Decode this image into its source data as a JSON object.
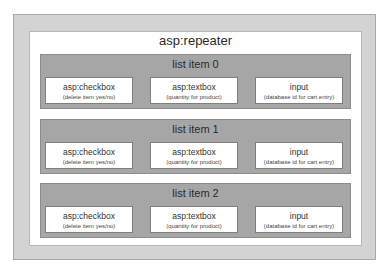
{
  "diagram": {
    "container": {
      "title": "asp:repeater"
    },
    "list_items": [
      {
        "label": "list item 0",
        "cells": [
          {
            "name": "asp:checkbox",
            "desc": "(delete item yes/no)"
          },
          {
            "name": "asp:textbox",
            "desc": "(quantity for product)"
          },
          {
            "name": "input",
            "desc": "(database id for cart entry)"
          }
        ]
      },
      {
        "label": "list item 1",
        "cells": [
          {
            "name": "asp:checkbox",
            "desc": "(delete item yes/no)"
          },
          {
            "name": "asp:textbox",
            "desc": "(quantity for product)"
          },
          {
            "name": "input",
            "desc": "(database id for cart entry)"
          }
        ]
      },
      {
        "label": "list item 2",
        "cells": [
          {
            "name": "asp:checkbox",
            "desc": "(delete item yes/no)"
          },
          {
            "name": "asp:textbox",
            "desc": "(quantity for product)"
          },
          {
            "name": "input",
            "desc": "(database id for cart entry)"
          }
        ]
      }
    ],
    "colors": {
      "outer_fill": "#d3d3d3",
      "inner_fill": "#ffffff",
      "list_item_fill": "#a6a6a6",
      "cell_fill": "#ffffff"
    }
  }
}
